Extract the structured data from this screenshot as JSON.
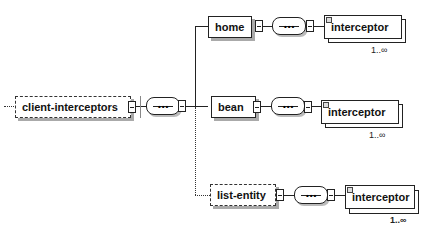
{
  "diagram": {
    "root": {
      "label": "client-interceptors",
      "optional": true
    },
    "compositor": {
      "type": "sequence",
      "glyph": "•••"
    },
    "children": [
      {
        "label": "home",
        "optional": false,
        "compositor_glyph": "•••",
        "child": {
          "label": "interceptor",
          "multiplicity": "1..∞"
        }
      },
      {
        "label": "bean",
        "optional": false,
        "compositor_glyph": "•••",
        "child": {
          "label": "interceptor",
          "multiplicity": "1..∞"
        }
      },
      {
        "label": "list-entity",
        "optional": true,
        "compositor_glyph": "•••",
        "child": {
          "label": "interceptor",
          "multiplicity": "1..∞"
        }
      }
    ]
  }
}
